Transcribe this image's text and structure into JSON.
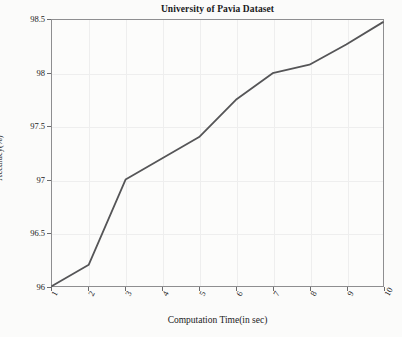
{
  "chart_data": {
    "type": "line",
    "title": "University of Pavia Dataset",
    "xlabel": "Computation Time(in sec)",
    "ylabel": "Accuracy(%)",
    "x": [
      1,
      2,
      3,
      4,
      5,
      6,
      7,
      8,
      9,
      10
    ],
    "values": [
      96.0,
      96.2,
      97.0,
      97.2,
      97.4,
      97.75,
      98.0,
      98.08,
      98.27,
      98.48
    ],
    "series": [
      {
        "name": "Accuracy",
        "values": [
          96.0,
          96.2,
          97.0,
          97.2,
          97.4,
          97.75,
          98.0,
          98.08,
          98.27,
          98.48
        ]
      }
    ],
    "xlim": [
      1,
      10
    ],
    "ylim": [
      96,
      98.5
    ],
    "xticks": [
      "1",
      "2",
      "3",
      "4",
      "5",
      "6",
      "7",
      "8",
      "9",
      "10"
    ],
    "yticks": [
      "96",
      "96.5",
      "97",
      "97.5",
      "98",
      "98.5"
    ],
    "ytick_values": [
      96,
      96.5,
      97,
      97.5,
      98,
      98.5
    ],
    "grid": true,
    "legend": null,
    "line_color": "#555557",
    "line_width": 1.8,
    "markers": false
  },
  "figure": {
    "background_color": "#fbfbfa",
    "axes_color": "#8e8e90",
    "grid_color": "#eeeeee",
    "text_color": "#1a1a1a"
  }
}
